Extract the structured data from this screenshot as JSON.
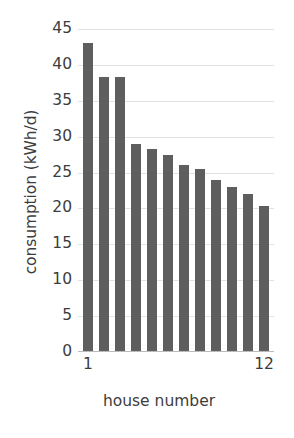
{
  "chart_data": {
    "type": "bar",
    "title": "",
    "xlabel": "house number",
    "ylabel": "consumption (kWh/d)",
    "categories": [
      "1",
      "2",
      "3",
      "4",
      "5",
      "6",
      "7",
      "8",
      "9",
      "10",
      "11",
      "12"
    ],
    "values": [
      43.0,
      38.3,
      38.3,
      29.0,
      28.3,
      27.5,
      26.0,
      25.5,
      24.0,
      23.0,
      22.0,
      20.3
    ],
    "ylim": [
      0,
      45
    ],
    "yticks": [
      0,
      5,
      10,
      15,
      20,
      25,
      30,
      35,
      40,
      45
    ],
    "ytick_labels": [
      "0",
      "5",
      "10",
      "15",
      "20",
      "25",
      "30",
      "35",
      "40",
      "45"
    ],
    "xtick_labels": [
      "1",
      "12"
    ],
    "xtick_categories": [
      "1",
      "12"
    ],
    "grid": true,
    "grid_axis": "y",
    "legend": null,
    "legend_position": "none",
    "bar_color": "#5e5e5e",
    "grid_color": "#e2e2e2",
    "axis_color": "#b9b9b9",
    "text_color": "#3d3d3d",
    "background_color": "#ffffff"
  }
}
